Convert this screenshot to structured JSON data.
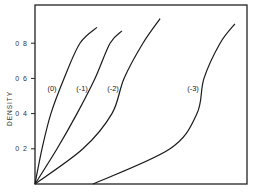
{
  "chart_data": {
    "type": "line",
    "title": "",
    "xlabel": "",
    "ylabel": "DENSITY",
    "ylim": [
      0,
      1.0
    ],
    "xlim": [
      0,
      1
    ],
    "yticks": [
      0.2,
      0.4,
      0.6,
      0.8
    ],
    "ytick_labels": [
      "0.2",
      "0.4",
      "0.6",
      "0.8"
    ],
    "xticks": [],
    "grid": false,
    "legend": "inline labels",
    "series": [
      {
        "name": "(0)",
        "x": [
          0,
          0.033,
          0.075,
          0.137,
          0.212,
          0.292
        ],
        "y": [
          0,
          0.2,
          0.4,
          0.6,
          0.8,
          0.89
        ],
        "label_pos": [
          52,
          91
        ]
      },
      {
        "name": "(-1)",
        "x": [
          0,
          0.104,
          0.198,
          0.283,
          0.354,
          0.41
        ],
        "y": [
          0,
          0.2,
          0.4,
          0.6,
          0.8,
          0.87
        ],
        "label_pos": [
          82,
          91
        ]
      },
      {
        "name": "(-2)",
        "x": [
          0,
          0.226,
          0.363,
          0.42,
          0.509,
          0.59
        ],
        "y": [
          0,
          0.2,
          0.4,
          0.6,
          0.8,
          0.94
        ],
        "label_pos": [
          113,
          91
        ]
      },
      {
        "name": "(-3)",
        "x": [
          0.274,
          0.637,
          0.764,
          0.797,
          0.873,
          0.943
        ],
        "y": [
          0,
          0.2,
          0.4,
          0.6,
          0.8,
          0.91
        ],
        "label_pos": [
          193,
          91
        ]
      }
    ]
  },
  "axes": {
    "y_title": "DENSITY",
    "tick_labels": [
      "0.2",
      "0.4",
      "0.6",
      "0.8"
    ]
  }
}
